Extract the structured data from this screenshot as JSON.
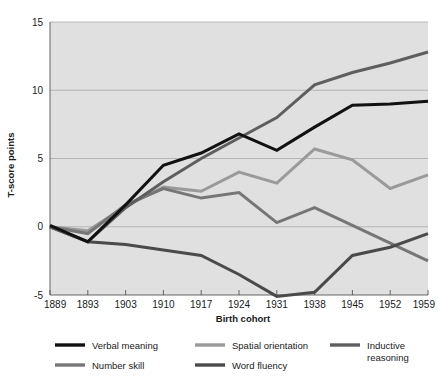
{
  "chart_data": {
    "type": "line",
    "title": "",
    "xlabel": "Birth cohort",
    "ylabel": "T-score points",
    "categories": [
      "1889",
      "1893",
      "1903",
      "1910",
      "1917",
      "1924",
      "1931",
      "1938",
      "1945",
      "1952",
      "1959"
    ],
    "xlim": [
      0,
      10
    ],
    "ylim": [
      -5,
      15
    ],
    "yticks": [
      "-5",
      "0",
      "5",
      "10",
      "15"
    ],
    "ytick_values": [
      -5,
      0,
      5,
      10,
      15
    ],
    "grid": "horizontal",
    "legend_position": "below",
    "series": [
      {
        "name": "Verbal meaning",
        "color": "#111111",
        "width": 3.0,
        "values": [
          0.1,
          -1.1,
          1.6,
          4.5,
          5.4,
          6.8,
          5.6,
          7.3,
          8.9,
          9.0,
          9.2
        ]
      },
      {
        "name": "Spatial orientation",
        "color": "#9a9a9a",
        "width": 3.0,
        "values": [
          0.0,
          -0.3,
          1.5,
          2.9,
          2.6,
          4.0,
          3.2,
          5.7,
          4.9,
          2.8,
          3.8
        ]
      },
      {
        "name": "Inductive reasoning",
        "color": "#5e5e5e",
        "width": 3.0,
        "values": [
          0.0,
          -1.1,
          1.4,
          3.3,
          5.0,
          6.5,
          8.0,
          10.4,
          11.3,
          12.0,
          12.8
        ]
      },
      {
        "name": "Number skill",
        "color": "#767676",
        "width": 3.0,
        "values": [
          0.0,
          -0.5,
          1.6,
          2.8,
          2.1,
          2.5,
          0.3,
          1.4,
          0.1,
          -1.2,
          -2.5
        ]
      },
      {
        "name": "Word fluency",
        "color": "#4a4a4a",
        "width": 3.0,
        "values": [
          0.0,
          -1.1,
          -1.3,
          -1.7,
          -2.1,
          -3.5,
          -5.1,
          -4.8,
          -2.1,
          -1.5,
          -0.5
        ]
      }
    ]
  },
  "axes": {
    "y_axis_title": "T-score points",
    "x_axis_title": "Birth cohort",
    "y_tick_labels": [
      "15",
      "10",
      "5",
      "0",
      "-5"
    ],
    "x_tick_labels": [
      "1889",
      "1893",
      "1903",
      "1910",
      "1917",
      "1924",
      "1931",
      "1938",
      "1945",
      "1952",
      "1959"
    ]
  },
  "legend": {
    "entries": [
      {
        "label": "Verbal meaning",
        "color": "#111111"
      },
      {
        "label": "Spatial orientation",
        "color": "#9a9a9a"
      },
      {
        "label": "Inductive",
        "label2": "reasoning",
        "color": "#5e5e5e"
      },
      {
        "label": "Number skill",
        "color": "#767676"
      },
      {
        "label": "Word fluency",
        "color": "#4a4a4a"
      }
    ]
  },
  "style": {
    "plot_background": "#e0e0e0",
    "page_background": "#ffffff",
    "gridline_color": "#a9a9a9",
    "axis_color": "#555555"
  }
}
